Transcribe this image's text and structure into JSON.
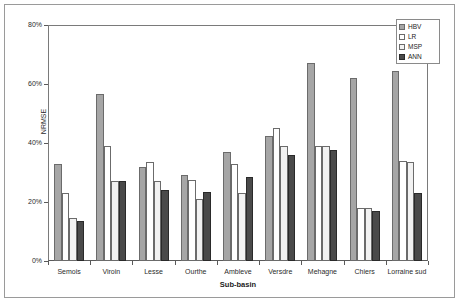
{
  "chart_data": {
    "type": "bar",
    "title": "",
    "xlabel": "Sub-basin",
    "ylabel": "NRMSE",
    "ylim": [
      0,
      80
    ],
    "yunit": "%",
    "ytick_labels": [
      "0%",
      "20%",
      "40%",
      "60%",
      "80%"
    ],
    "ytick_values": [
      0,
      20,
      40,
      60,
      80
    ],
    "grid": false,
    "legend_position": "top-right",
    "categories": [
      "Semois",
      "Viroin",
      "Lesse",
      "Ourthe",
      "Ambleve",
      "Versdre",
      "Mehagne",
      "Chiers",
      "Lorraine sud"
    ],
    "series": [
      {
        "name": "HBV",
        "fill": "solid-gray",
        "color": "#a6a6a6",
        "values": [
          33,
          56.5,
          32,
          29,
          37,
          42.5,
          67,
          62,
          64.5
        ]
      },
      {
        "name": "LR",
        "fill": "white",
        "color": "#ffffff",
        "values": [
          23,
          39,
          33.5,
          27.5,
          33,
          45,
          39,
          18,
          34
        ]
      },
      {
        "name": "MSP",
        "fill": "dotted",
        "color": "#f2f2f2",
        "values": [
          14.5,
          27,
          27,
          21,
          23,
          39,
          39,
          18,
          33.5
        ]
      },
      {
        "name": "ANN",
        "fill": "dark-gray",
        "color": "#4a4a4a",
        "values": [
          13.5,
          27,
          24,
          23.5,
          28.5,
          36,
          37.5,
          17,
          23
        ]
      }
    ]
  },
  "legend": {
    "items": [
      {
        "label": "HBV"
      },
      {
        "label": "LR"
      },
      {
        "label": "MSP"
      },
      {
        "label": "ANN"
      }
    ]
  }
}
